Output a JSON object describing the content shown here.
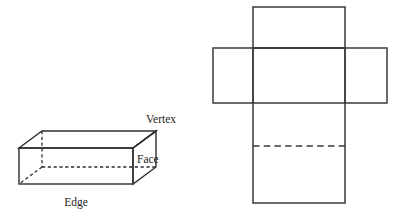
{
  "figure": {
    "background_color": "#ffffff",
    "line_color": "#2e2e2e",
    "net_line_color": "#3a3a3a",
    "text_color": "#1d1d1d"
  },
  "cuboid": {
    "name": "labelled-cuboid",
    "labels": {
      "vertex": "Vertex",
      "face": "Face",
      "edge": "Edge"
    },
    "visible_edge_count": 9,
    "hidden_edge_count": 3,
    "geometry": {
      "front_top_left": [
        19,
        148
      ],
      "front_top_right": [
        133,
        148
      ],
      "front_bottom_left": [
        19,
        184
      ],
      "front_bottom_right": [
        133,
        184
      ],
      "back_top_left": [
        42,
        131
      ],
      "back_top_right": [
        156,
        131
      ],
      "back_bottom_left": [
        42,
        167
      ],
      "back_bottom_right": [
        156,
        167
      ]
    }
  },
  "net": {
    "name": "cuboid-net",
    "rectangles": [
      {
        "id": "top-flap",
        "x": 253,
        "y": 7,
        "w": 92,
        "h": 41
      },
      {
        "id": "left-flap",
        "x": 213,
        "y": 48,
        "w": 40,
        "h": 55
      },
      {
        "id": "middle-face",
        "x": 253,
        "y": 48,
        "w": 92,
        "h": 55
      },
      {
        "id": "right-flap",
        "x": 345,
        "y": 48,
        "w": 42,
        "h": 55
      },
      {
        "id": "lower-face",
        "x": 253,
        "y": 103,
        "w": 92,
        "h": 43
      },
      {
        "id": "bottom-flap",
        "x": 253,
        "y": 146,
        "w": 92,
        "h": 57
      }
    ],
    "fold_line": {
      "id": "dashed-fold",
      "x1": 253,
      "y1": 146,
      "x2": 345,
      "y2": 146
    }
  }
}
